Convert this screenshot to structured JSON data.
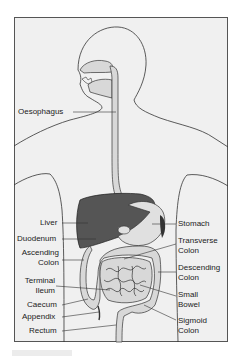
{
  "figure": {
    "colors": {
      "background": "#f0f0f0",
      "outline": "#333333",
      "liver": "#555555",
      "organ_fill": "#d8d8d8"
    }
  },
  "labels": {
    "left": [
      {
        "id": "oesophagus",
        "line1": "Oesophagus",
        "line2": ""
      },
      {
        "id": "liver",
        "line1": "Liver",
        "line2": ""
      },
      {
        "id": "duodenum",
        "line1": "Duodenum",
        "line2": ""
      },
      {
        "id": "ascending-colon",
        "line1": "Ascending",
        "line2": "Colon"
      },
      {
        "id": "terminal-ileum",
        "line1": "Terminal",
        "line2": "Ileum"
      },
      {
        "id": "caecum",
        "line1": "Caecum",
        "line2": ""
      },
      {
        "id": "appendix",
        "line1": "Appendix",
        "line2": ""
      },
      {
        "id": "rectum",
        "line1": "Rectum",
        "line2": ""
      }
    ],
    "right": [
      {
        "id": "stomach",
        "line1": "Stomach",
        "line2": ""
      },
      {
        "id": "transverse-colon",
        "line1": "Transverse",
        "line2": "Colon"
      },
      {
        "id": "descending-colon",
        "line1": "Descending",
        "line2": "Colon"
      },
      {
        "id": "small-bowel",
        "line1": "Small",
        "line2": "Bowel"
      },
      {
        "id": "sigmoid-colon",
        "line1": "Sigmoid",
        "line2": "Colon"
      }
    ]
  }
}
